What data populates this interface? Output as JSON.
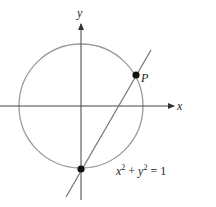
{
  "diagram": {
    "axes": {
      "x_label": "x",
      "y_label": "y"
    },
    "circle": {
      "equation_base_x": "x",
      "equation_sup_x": "2",
      "equation_plus": " + ",
      "equation_base_y": "y",
      "equation_sup_y": "2",
      "equation_rhs": " = 1",
      "color": "#9a9a9a"
    },
    "line": {
      "color": "#7a7a7a"
    },
    "points": [
      {
        "label": "P"
      },
      {
        "label": ""
      }
    ]
  }
}
